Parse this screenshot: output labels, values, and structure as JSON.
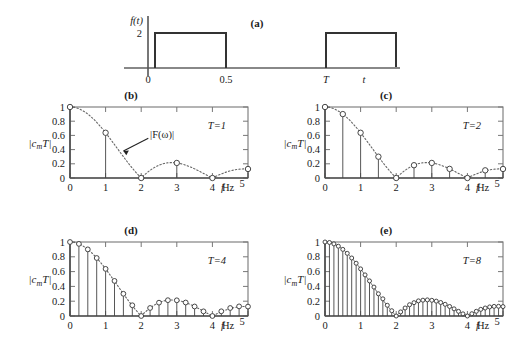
{
  "figure": {
    "panels": [
      {
        "key": "a",
        "label": "(a)",
        "type": "time-domain"
      },
      {
        "key": "b",
        "label": "(b)",
        "type": "spectrum"
      },
      {
        "key": "c",
        "label": "(c)",
        "type": "spectrum"
      },
      {
        "key": "d",
        "label": "(d)",
        "type": "spectrum"
      },
      {
        "key": "e",
        "label": "(e)",
        "type": "spectrum"
      }
    ]
  },
  "panel_a": {
    "label": "(a)",
    "ylabel": "f(t)",
    "amplitude_label": "2",
    "xticks": [
      "0",
      "0.5",
      "T"
    ],
    "xaxis_symbol": "t",
    "pulse_amplitude": 2,
    "pulse_start": 0,
    "pulse_end": 0.5,
    "period_symbol": "T"
  },
  "common": {
    "ylabel": "|c",
    "ylabel_sub": "m",
    "ylabel_tail": "T|",
    "yticks": [
      "0",
      "0.2",
      "0.4",
      "0.6",
      "0.8",
      "1"
    ],
    "xticks": [
      "0",
      "1",
      "2",
      "3",
      "4"
    ],
    "xaxis_var": "f",
    "xaxis_unit": "Hz",
    "xaxis_end": "5",
    "envelope_label": "|F(ω)|"
  },
  "chart_data": [
    {
      "type": "line",
      "panel": "b",
      "title": "(b)",
      "annotation": "T=1",
      "annotation_value": 1,
      "xlabel": "f",
      "ylabel": "|cmT|",
      "xlim": [
        0,
        5
      ],
      "ylim": [
        0,
        1
      ],
      "xticks": [
        0,
        1,
        2,
        3,
        4,
        5
      ],
      "yticks": [
        0,
        0.2,
        0.4,
        0.6,
        0.8,
        1
      ],
      "grid": false,
      "legend": "none",
      "annotations": [
        {
          "text": "|F(ω)|",
          "points_to": "envelope"
        }
      ],
      "series": [
        {
          "name": "|cmT| stems",
          "style": "stem-with-circle-markers",
          "x": [
            0,
            1,
            2,
            3,
            4,
            5
          ],
          "values": [
            1.0,
            0.637,
            0.0,
            0.212,
            0.0,
            0.127
          ]
        },
        {
          "name": "|F(ω)| envelope",
          "style": "dotted",
          "formula": "|sinc(0.5 f)|",
          "x": [
            0,
            0.25,
            0.5,
            0.75,
            1,
            1.25,
            1.5,
            1.75,
            2,
            2.25,
            2.5,
            2.75,
            3,
            3.25,
            3.5,
            3.75,
            4,
            4.25,
            4.5,
            4.75,
            5
          ],
          "values": [
            1.0,
            0.9745,
            0.9003,
            0.7838,
            0.6366,
            0.4742,
            0.3001,
            0.1449,
            0.0,
            0.1083,
            0.1801,
            0.2137,
            0.2122,
            0.1823,
            0.1286,
            0.0628,
            0.0,
            0.0637,
            0.108,
            0.13,
            0.1273
          ]
        }
      ]
    },
    {
      "type": "line",
      "panel": "c",
      "title": "(c)",
      "annotation": "T=2",
      "annotation_value": 2,
      "xlabel": "f",
      "ylabel": "|cmT|",
      "xlim": [
        0,
        5
      ],
      "ylim": [
        0,
        1
      ],
      "xticks": [
        0,
        1,
        2,
        3,
        4,
        5
      ],
      "yticks": [
        0,
        0.2,
        0.4,
        0.6,
        0.8,
        1
      ],
      "grid": false,
      "legend": "none",
      "series": [
        {
          "name": "|cmT| stems",
          "style": "stem-with-circle-markers",
          "x": [
            0,
            0.5,
            1,
            1.5,
            2,
            2.5,
            3,
            3.5,
            4,
            4.5,
            5
          ],
          "values": [
            1.0,
            0.9003,
            0.637,
            0.3001,
            0.0,
            0.1801,
            0.2122,
            0.1286,
            0.0,
            0.108,
            0.1273
          ]
        },
        {
          "name": "|F(ω)| envelope",
          "style": "dotted",
          "formula": "|sinc(0.5 f)|",
          "x": [
            0,
            0.25,
            0.5,
            0.75,
            1,
            1.25,
            1.5,
            1.75,
            2,
            2.25,
            2.5,
            2.75,
            3,
            3.25,
            3.5,
            3.75,
            4,
            4.25,
            4.5,
            4.75,
            5
          ],
          "values": [
            1.0,
            0.9745,
            0.9003,
            0.7838,
            0.6366,
            0.4742,
            0.3001,
            0.1449,
            0.0,
            0.1083,
            0.1801,
            0.2137,
            0.2122,
            0.1823,
            0.1286,
            0.0628,
            0.0,
            0.0637,
            0.108,
            0.13,
            0.1273
          ]
        }
      ]
    },
    {
      "type": "line",
      "panel": "d",
      "title": "(d)",
      "annotation": "T=4",
      "annotation_value": 4,
      "xlabel": "f",
      "ylabel": "|cmT|",
      "xlim": [
        0,
        5
      ],
      "ylim": [
        0,
        1
      ],
      "xticks": [
        0,
        1,
        2,
        3,
        4,
        5
      ],
      "yticks": [
        0,
        0.2,
        0.4,
        0.6,
        0.8,
        1
      ],
      "grid": false,
      "legend": "none",
      "series": [
        {
          "name": "|cmT| stems",
          "style": "stem-with-circle-markers",
          "x": [
            0,
            0.25,
            0.5,
            0.75,
            1,
            1.25,
            1.5,
            1.75,
            2,
            2.25,
            2.5,
            2.75,
            3,
            3.25,
            3.5,
            3.75,
            4,
            4.25,
            4.5,
            4.75,
            5
          ],
          "values": [
            1.0,
            0.9745,
            0.9003,
            0.7838,
            0.6366,
            0.4742,
            0.3001,
            0.1449,
            0.0,
            0.1083,
            0.1801,
            0.2137,
            0.2122,
            0.1823,
            0.1286,
            0.0628,
            0.0,
            0.0637,
            0.108,
            0.13,
            0.1273
          ]
        },
        {
          "name": "|F(ω)| envelope",
          "style": "dotted",
          "formula": "|sinc(0.5 f)|"
        }
      ]
    },
    {
      "type": "line",
      "panel": "e",
      "title": "(e)",
      "annotation": "T=8",
      "annotation_value": 8,
      "xlabel": "f",
      "ylabel": "|cmT|",
      "xlim": [
        0,
        5
      ],
      "ylim": [
        0,
        1
      ],
      "xticks": [
        0,
        1,
        2,
        3,
        4,
        5
      ],
      "yticks": [
        0,
        0.2,
        0.4,
        0.6,
        0.8,
        1
      ],
      "grid": false,
      "legend": "none",
      "series": [
        {
          "name": "|cmT| stems",
          "style": "stem-with-circle-markers",
          "spacing": 0.125,
          "x": [
            0,
            0.125,
            0.25,
            0.375,
            0.5,
            0.625,
            0.75,
            0.875,
            1,
            1.125,
            1.25,
            1.375,
            1.5,
            1.625,
            1.75,
            1.875,
            2,
            2.125,
            2.25,
            2.375,
            2.5,
            2.625,
            2.75,
            2.875,
            3,
            3.125,
            3.25,
            3.375,
            3.5,
            3.625,
            3.75,
            3.875,
            4,
            4.125,
            4.25,
            4.375,
            4.5,
            4.625,
            4.75,
            4.875,
            5
          ],
          "values": [
            1.0,
            0.9936,
            0.9745,
            0.9432,
            0.9003,
            0.8467,
            0.7838,
            0.7129,
            0.6366,
            0.5557,
            0.4742,
            0.3909,
            0.3001,
            0.2322,
            0.1449,
            0.0714,
            0.0,
            0.0552,
            0.1083,
            0.1524,
            0.1801,
            0.2043,
            0.2137,
            0.2177,
            0.2122,
            0.2009,
            0.1823,
            0.1583,
            0.1286,
            0.0969,
            0.0628,
            0.029,
            0.0,
            0.0307,
            0.0637,
            0.0898,
            0.108,
            0.1226,
            0.13,
            0.131,
            0.1273
          ]
        },
        {
          "name": "|F(ω)| envelope",
          "style": "solid-thin",
          "formula": "|sinc(0.5 f)|"
        }
      ]
    }
  ]
}
